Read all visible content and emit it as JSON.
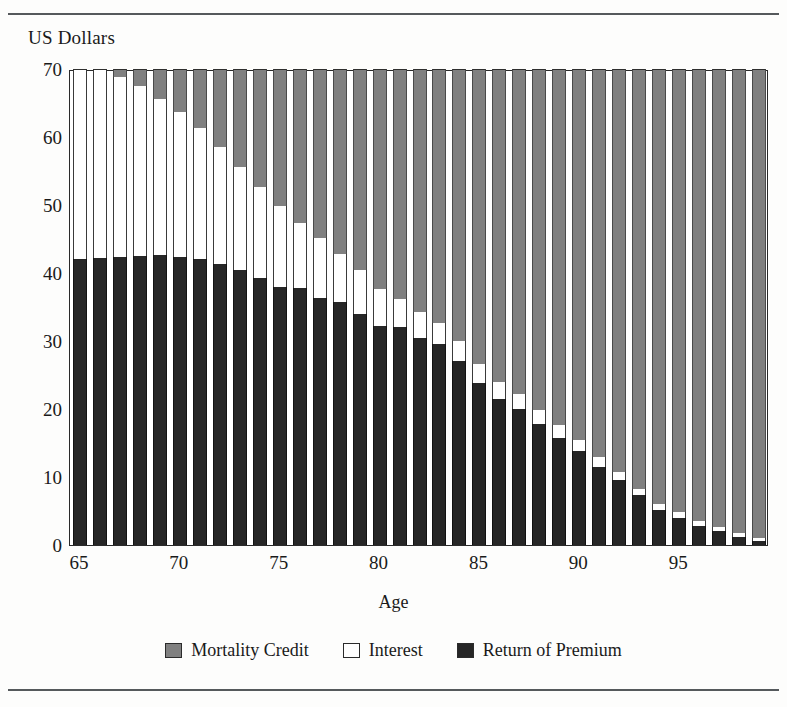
{
  "figure": {
    "y_axis_title": "US Dollars",
    "x_axis_title": "Age"
  },
  "legend": {
    "items": [
      {
        "label": "Mortality Credit",
        "color": "#808080",
        "key": "mortality_credit"
      },
      {
        "label": "Interest",
        "color": "#ffffff",
        "key": "interest"
      },
      {
        "label": "Return of Premium",
        "color": "#262626",
        "key": "return_of_premium"
      }
    ]
  },
  "axes": {
    "y_ticks": [
      "0",
      "10",
      "20",
      "30",
      "40",
      "50",
      "60",
      "70"
    ],
    "x_ticks": [
      "65",
      "70",
      "75",
      "80",
      "85",
      "90",
      "95"
    ]
  },
  "chart_data": {
    "type": "bar",
    "stacked": true,
    "title": "",
    "xlabel": "Age",
    "ylabel": "US Dollars",
    "ylim": [
      0,
      70
    ],
    "xlim": [
      64.5,
      99.5
    ],
    "grid": false,
    "legend_position": "bottom",
    "categories": [
      65,
      66,
      67,
      68,
      69,
      70,
      71,
      72,
      73,
      74,
      75,
      76,
      77,
      78,
      79,
      80,
      81,
      82,
      83,
      84,
      85,
      86,
      87,
      88,
      89,
      90,
      91,
      92,
      93,
      94,
      95,
      96,
      97,
      98,
      99
    ],
    "series": [
      {
        "name": "Return of Premium",
        "color": "#262626",
        "values": [
          42.0,
          42.2,
          42.3,
          42.5,
          42.6,
          42.4,
          42.0,
          41.3,
          40.4,
          39.3,
          38.0,
          37.8,
          36.3,
          35.8,
          34.0,
          32.2,
          32.0,
          30.5,
          29.5,
          27.0,
          23.8,
          21.5,
          20.0,
          17.8,
          15.8,
          13.8,
          11.5,
          9.5,
          7.3,
          5.2,
          4.0,
          2.8,
          2.0,
          1.2,
          0.6
        ]
      },
      {
        "name": "Interest",
        "color": "#ffffff",
        "values": [
          28.0,
          27.8,
          26.5,
          25.0,
          23.0,
          21.3,
          19.3,
          17.2,
          15.2,
          13.4,
          11.8,
          9.5,
          8.8,
          7.0,
          6.5,
          5.5,
          4.2,
          3.8,
          3.2,
          3.0,
          2.8,
          2.5,
          2.2,
          2.0,
          1.8,
          1.6,
          1.4,
          1.2,
          1.0,
          0.9,
          0.8,
          0.7,
          0.6,
          0.5,
          0.4
        ]
      },
      {
        "name": "Mortality Credit",
        "color": "#808080",
        "values": [
          0.0,
          0.0,
          1.2,
          2.5,
          4.4,
          6.3,
          8.7,
          11.5,
          14.4,
          17.3,
          20.2,
          22.7,
          24.9,
          27.2,
          29.5,
          32.3,
          33.8,
          35.7,
          37.3,
          40.0,
          43.4,
          46.0,
          47.8,
          50.2,
          52.4,
          54.6,
          57.1,
          59.3,
          61.7,
          63.9,
          65.2,
          66.5,
          67.4,
          68.3,
          69.0
        ]
      }
    ]
  }
}
